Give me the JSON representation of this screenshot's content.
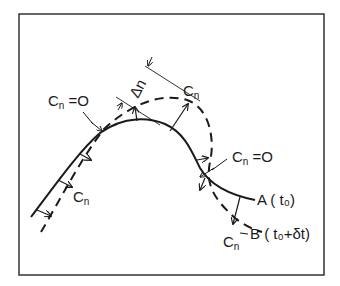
{
  "figure": {
    "type": "interface-propagation-diagram",
    "curves": [
      {
        "id": "A",
        "style": "solid",
        "label": "A",
        "time": "(t₀)"
      },
      {
        "id": "B",
        "style": "dashed",
        "label": "B",
        "time": "(t₀+δt)"
      }
    ],
    "labels": {
      "cn_zero_left": {
        "base": "C",
        "sub": "n",
        "rest": " =O"
      },
      "cn_zero_right": {
        "base": "C",
        "sub": "n",
        "rest": " =O"
      },
      "cn_top": {
        "base": "C",
        "sub": "n"
      },
      "cn_left": {
        "base": "C",
        "sub": "n"
      },
      "cn_bottom": {
        "base": "C",
        "sub": "n"
      },
      "delta_n": "Δn",
      "curve_a": "A ( t₀)",
      "curve_b": "B ( t₀+δt)"
    },
    "colors": {
      "ink": "#1a1a1a",
      "frame": "#333333",
      "background": "#ffffff"
    }
  }
}
